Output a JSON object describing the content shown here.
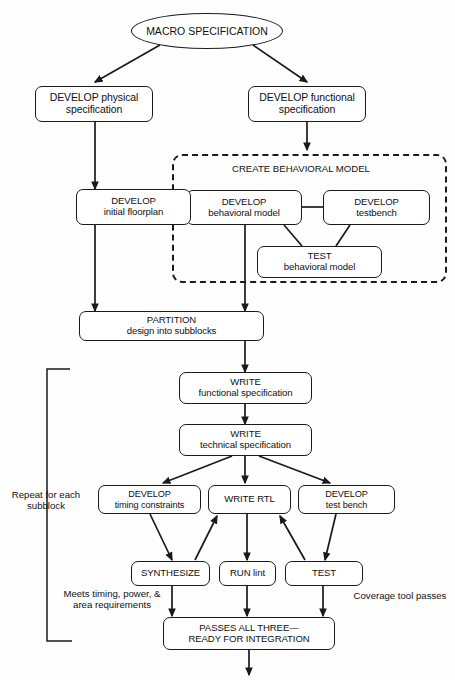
{
  "diagram": {
    "background_color": "#fefefe",
    "stroke_color": "#1a1a1a"
  },
  "nodes": {
    "macro_spec": {
      "text": "MACRO SPECIFICATION"
    },
    "develop_physical": {
      "line1": "DEVELOP physical",
      "line2": "specification"
    },
    "develop_functional": {
      "line1": "DEVELOP functional",
      "line2": "specification"
    },
    "develop_floorplan": {
      "line1": "DEVELOP",
      "line2": "initial floorplan"
    },
    "develop_behavioral": {
      "line1": "DEVELOP",
      "line2": "behavioral model"
    },
    "develop_testbench": {
      "line1": "DEVELOP",
      "line2": "testbench"
    },
    "test_behavioral": {
      "line1": "TEST",
      "line2": "behavioral model"
    },
    "partition": {
      "line1": "PARTITION",
      "line2": "design into subblocks"
    },
    "write_functional": {
      "line1": "WRITE",
      "line2": "functional specification"
    },
    "write_technical": {
      "line1": "WRITE",
      "line2": "technical specification"
    },
    "develop_timing": {
      "line1": "DEVELOP",
      "line2": "timing constraints"
    },
    "write_rtl": {
      "line1": "WRITE RTL"
    },
    "develop_testbench2": {
      "line1": "DEVELOP",
      "line2": "test bench"
    },
    "synthesize": {
      "line1": "SYNTHESIZE"
    },
    "run_lint": {
      "line1": "RUN lint"
    },
    "test": {
      "line1": "TEST"
    },
    "passes_all": {
      "line1": "PASSES ALL THREE—",
      "line2": "READY FOR INTEGRATION"
    }
  },
  "groups": {
    "behavioral_model": {
      "label": "CREATE BEHAVIORAL MODEL"
    }
  },
  "annotations": {
    "repeat_subblock": {
      "line1": "Repeat for",
      "line2": "each",
      "line3": "subblock"
    },
    "meets_timing": {
      "line1": "Meets timing,",
      "line2": "power, & area",
      "line3": "requirements"
    },
    "coverage_tool": {
      "line1": "Coverage tool",
      "line2": "passes"
    }
  }
}
